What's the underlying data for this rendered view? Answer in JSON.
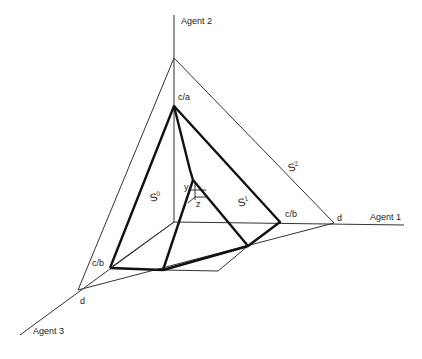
{
  "axes": {
    "agent1": "Agent 1",
    "agent2": "Agent 2",
    "agent3": "Agent 3"
  },
  "points": {
    "top": "c/a",
    "right_inner": "c/b",
    "left_inner": "c/b",
    "right_outer": "d",
    "left_outer": "d",
    "center_y": "y",
    "center_z": "z"
  },
  "simplices": {
    "s0_base": "S",
    "s0_sup": "0",
    "s1_base": "S",
    "s1_sup": "1",
    "s2_base": "S",
    "s2_sup": "2"
  }
}
